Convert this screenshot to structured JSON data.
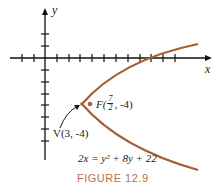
{
  "figure": {
    "caption": "FIGURE 12.9",
    "axis_labels": {
      "x": "x",
      "y": "y"
    },
    "focus_label": {
      "prefix": "F(",
      "num": "7",
      "den": "2",
      "suffix": ", -4)"
    },
    "vertex_label": "V(3, -4)",
    "equation": "2x = y² + 8y + 22",
    "colors": {
      "curve": "#a0603a",
      "axes": "#111111",
      "caption": "#b5714a"
    }
  }
}
